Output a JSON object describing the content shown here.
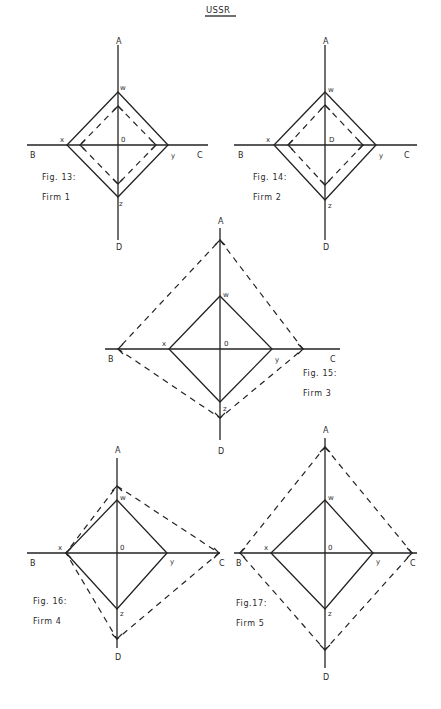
{
  "page": {
    "title": "USSR",
    "background": "#ffffff",
    "ink": "#222222"
  },
  "figures": [
    {
      "id": "fig13",
      "caption": "Fig. 13:",
      "firm": "Firm 1",
      "center": [
        118,
        145
      ],
      "axis_h": [
        27,
        208
      ],
      "axis_v": [
        45,
        240
      ],
      "solid": {
        "w": 92,
        "x": 67,
        "y": 168,
        "z": 197
      },
      "dashed": {
        "A": 106,
        "B": 80,
        "C": 156,
        "D": 184
      },
      "labels": {
        "A": {
          "text": "A",
          "pos": [
            116,
            44
          ]
        },
        "B": {
          "text": "B",
          "pos": [
            30,
            158
          ]
        },
        "C": {
          "text": "C",
          "pos": [
            197,
            158
          ]
        },
        "D": {
          "text": "D",
          "pos": [
            116,
            250
          ]
        },
        "w": {
          "text": "w",
          "pos": [
            120,
            90
          ]
        },
        "x": {
          "text": "x",
          "pos": [
            60,
            142
          ]
        },
        "y": {
          "text": "y",
          "pos": [
            171,
            158
          ]
        },
        "z": {
          "text": "z",
          "pos": [
            119,
            206
          ]
        },
        "O": {
          "text": "0",
          "pos": [
            121,
            142
          ]
        }
      },
      "caption_pos": [
        42,
        180
      ],
      "firm_pos": [
        42,
        200
      ]
    },
    {
      "id": "fig14",
      "caption": "Fig. 14:",
      "firm": "Firm 2",
      "center": [
        325,
        145
      ],
      "axis_h": [
        234,
        417
      ],
      "axis_v": [
        45,
        240
      ],
      "solid": {
        "w": 92,
        "x": 274,
        "y": 376,
        "z": 200
      },
      "dashed": {
        "A": 105,
        "B": 288,
        "C": 363,
        "D": 185
      },
      "labels": {
        "A": {
          "text": "A",
          "pos": [
            323,
            44
          ]
        },
        "B": {
          "text": "B",
          "pos": [
            238,
            158
          ]
        },
        "C": {
          "text": "C",
          "pos": [
            404,
            158
          ]
        },
        "D": {
          "text": "D",
          "pos": [
            323,
            250
          ]
        },
        "w": {
          "text": "w",
          "pos": [
            328,
            92
          ]
        },
        "x": {
          "text": "x",
          "pos": [
            266,
            142
          ]
        },
        "y": {
          "text": "y",
          "pos": [
            379,
            158
          ]
        },
        "z": {
          "text": "z",
          "pos": [
            328,
            208
          ]
        },
        "O": {
          "text": "D",
          "pos": [
            329,
            142
          ]
        }
      },
      "caption_pos": [
        253,
        180
      ],
      "firm_pos": [
        253,
        200
      ]
    },
    {
      "id": "fig15",
      "caption": "Fig. 15:",
      "firm": "Firm 3",
      "center": [
        220,
        349
      ],
      "axis_h": [
        105,
        340
      ],
      "axis_v": [
        228,
        440
      ],
      "solid": {
        "w": 296,
        "x": 169,
        "y": 272,
        "z": 402
      },
      "dashed": {
        "A": 240,
        "B": 118,
        "C": 303,
        "D": 418
      },
      "labels": {
        "A": {
          "text": "A",
          "pos": [
            218,
            224
          ]
        },
        "B": {
          "text": "B",
          "pos": [
            108,
            362
          ]
        },
        "C": {
          "text": "C",
          "pos": [
            330,
            362
          ]
        },
        "D": {
          "text": "D",
          "pos": [
            218,
            454
          ]
        },
        "w": {
          "text": "w",
          "pos": [
            223,
            297
          ]
        },
        "x": {
          "text": "x",
          "pos": [
            162,
            346
          ]
        },
        "y": {
          "text": "y",
          "pos": [
            275,
            362
          ]
        },
        "z": {
          "text": "z",
          "pos": [
            223,
            411
          ]
        },
        "O": {
          "text": "0",
          "pos": [
            224,
            346
          ]
        }
      },
      "caption_pos": [
        303,
        376
      ],
      "firm_pos": [
        303,
        396
      ]
    },
    {
      "id": "fig16",
      "caption": "Fig. 16:",
      "firm": "Firm 4",
      "center": [
        117,
        553
      ],
      "axis_h": [
        27,
        220
      ],
      "axis_v": [
        458,
        648
      ],
      "solid": {
        "w": 500,
        "x": 66,
        "y": 167,
        "z": 609
      },
      "dashed": {
        "A": 486,
        "B": 66,
        "C": 219,
        "D": 639
      },
      "labels": {
        "A": {
          "text": "A",
          "pos": [
            115,
            453
          ]
        },
        "B": {
          "text": "B",
          "pos": [
            30,
            566
          ]
        },
        "C": {
          "text": "C",
          "pos": [
            219,
            566
          ]
        },
        "D": {
          "text": "D",
          "pos": [
            115,
            660
          ]
        },
        "w": {
          "text": "w",
          "pos": [
            120,
            500
          ]
        },
        "x": {
          "text": "x",
          "pos": [
            58,
            550
          ]
        },
        "y": {
          "text": "y",
          "pos": [
            170,
            564
          ]
        },
        "z": {
          "text": "z",
          "pos": [
            120,
            616
          ]
        },
        "O": {
          "text": "0",
          "pos": [
            120,
            550
          ]
        }
      },
      "caption_pos": [
        33,
        604
      ],
      "firm_pos": [
        33,
        624
      ]
    },
    {
      "id": "fig17",
      "caption": "Fig.17:",
      "firm": "Firm 5",
      "center": [
        325,
        553
      ],
      "axis_h": [
        234,
        417
      ],
      "axis_v": [
        438,
        668
      ],
      "solid": {
        "w": 500,
        "x": 271,
        "y": 373,
        "z": 609
      },
      "dashed": {
        "A": 447,
        "B": 240,
        "C": 412,
        "D": 650
      },
      "labels": {
        "A": {
          "text": "A",
          "pos": [
            323,
            433
          ]
        },
        "B": {
          "text": "B",
          "pos": [
            236,
            566
          ]
        },
        "C": {
          "text": "C",
          "pos": [
            410,
            566
          ]
        },
        "D": {
          "text": "D",
          "pos": [
            323,
            680
          ]
        },
        "w": {
          "text": "w",
          "pos": [
            328,
            500
          ]
        },
        "x": {
          "text": "x",
          "pos": [
            264,
            550
          ]
        },
        "y": {
          "text": "y",
          "pos": [
            376,
            564
          ]
        },
        "z": {
          "text": "z",
          "pos": [
            328,
            616
          ]
        },
        "O": {
          "text": "0",
          "pos": [
            328,
            550
          ]
        }
      },
      "caption_pos": [
        236,
        606
      ],
      "firm_pos": [
        236,
        626
      ]
    }
  ]
}
